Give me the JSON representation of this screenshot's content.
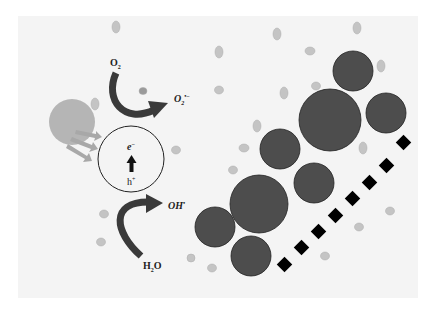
{
  "diagram": {
    "title": "",
    "type": "photocatalysis mechanism schematic",
    "labels": {
      "o2": "O",
      "o2_sub": "2",
      "superoxide": "O",
      "superoxide_sub": "2",
      "superoxide_sup": "•−",
      "electron": "e",
      "electron_sup": "−",
      "hole": "h",
      "hole_sup": "+",
      "hydroxyl": "OH",
      "hydroxyl_sup": "•",
      "water": "H",
      "water_sub": "2",
      "water_tail": "O"
    },
    "colors": {
      "background": "#f4f4f4",
      "light_source": "#b5b5b5",
      "light_rays": "#a8a8a8",
      "particle_dark": "#4d4d4d",
      "particle_small": "#c4c4c4",
      "arrow": "#333333",
      "dash_block": "#000000"
    },
    "components": [
      "light-source",
      "light-rays",
      "photocatalyst-particle",
      "reduction-arrow",
      "oxidation-arrow",
      "pollutant-aggregates",
      "dashed-surface",
      "small-molecules"
    ]
  }
}
